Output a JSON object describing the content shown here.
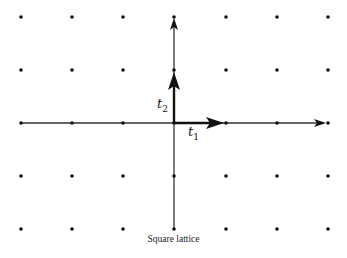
{
  "diagram": {
    "title": "Square lattice",
    "lattice": {
      "type": "square",
      "columns_x": [
        21,
        72,
        123,
        174,
        226,
        277,
        328
      ],
      "rows_y": [
        17,
        70,
        123,
        176,
        229
      ],
      "origin": [
        174,
        123
      ],
      "dot_color": "#111111"
    },
    "axes": {
      "horizontal": {
        "from": [
          21,
          123
        ],
        "to": [
          326,
          123
        ]
      },
      "vertical": {
        "from": [
          174,
          229
        ],
        "to": [
          174,
          19
        ]
      }
    },
    "vectors": [
      {
        "name": "t1",
        "label": "t",
        "subscript": "1",
        "from": [
          174,
          123
        ],
        "to": [
          224,
          123
        ]
      },
      {
        "name": "t2",
        "label": "t",
        "subscript": "2",
        "from": [
          174,
          123
        ],
        "to": [
          174,
          72
        ]
      }
    ]
  }
}
